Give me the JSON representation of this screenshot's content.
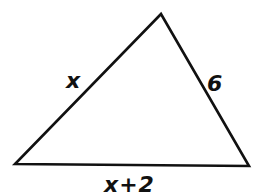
{
  "figure": {
    "type": "triangle",
    "stroke_color": "#111111",
    "background": "#ffffff",
    "vertices": {
      "top": [
        161,
        14
      ],
      "bottom_left": [
        15,
        164
      ],
      "bottom_right": [
        249,
        166
      ]
    },
    "sides": {
      "left": {
        "label": "x",
        "between": [
          "bottom_left",
          "top"
        ]
      },
      "right": {
        "label": "6",
        "between": [
          "top",
          "bottom_right"
        ]
      },
      "bottom": {
        "label": "x+2",
        "between": [
          "bottom_left",
          "bottom_right"
        ]
      }
    }
  }
}
